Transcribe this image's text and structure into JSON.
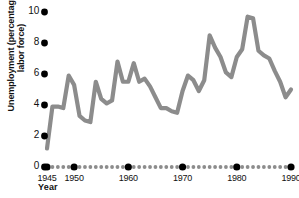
{
  "chart_data": {
    "type": "line",
    "title": "",
    "xlabel": "Year",
    "ylabel": "Unemployment (percentage of labor force)",
    "xlim": [
      1945,
      1990
    ],
    "ylim": [
      0,
      10
    ],
    "grid": false,
    "legend": false,
    "line_color": "#8c8c8c",
    "x": [
      1945,
      1946,
      1947,
      1948,
      1949,
      1950,
      1951,
      1952,
      1953,
      1954,
      1955,
      1956,
      1957,
      1958,
      1959,
      1960,
      1961,
      1962,
      1963,
      1964,
      1965,
      1966,
      1967,
      1968,
      1969,
      1970,
      1971,
      1972,
      1973,
      1974,
      1975,
      1976,
      1977,
      1978,
      1979,
      1980,
      1981,
      1982,
      1983,
      1984,
      1985,
      1986,
      1987,
      1988,
      1989,
      1990
    ],
    "values": [
      1.2,
      3.9,
      3.9,
      3.8,
      5.9,
      5.3,
      3.3,
      3.0,
      2.9,
      5.5,
      4.4,
      4.1,
      4.3,
      6.8,
      5.5,
      5.5,
      6.7,
      5.5,
      5.7,
      5.2,
      4.5,
      3.8,
      3.8,
      3.6,
      3.5,
      4.9,
      5.9,
      5.6,
      4.9,
      5.6,
      8.5,
      7.7,
      7.1,
      6.1,
      5.8,
      7.1,
      7.6,
      9.7,
      9.6,
      7.5,
      7.2,
      7.0,
      6.2,
      5.5,
      4.5,
      5.0
    ],
    "yticks": [
      {
        "label": "10",
        "value": 10
      },
      {
        "label": "8",
        "value": 8
      },
      {
        "label": "6",
        "value": 6
      },
      {
        "label": "4",
        "value": 4
      },
      {
        "label": "2",
        "value": 2
      },
      {
        "label": "0",
        "value": 0
      }
    ],
    "xticks_major": [
      {
        "label": "1945",
        "value": 1945
      },
      {
        "label": "1950",
        "value": 1950
      },
      {
        "label": "1960",
        "value": 1960
      },
      {
        "label": "1970",
        "value": 1970
      },
      {
        "label": "1980",
        "value": 1980
      },
      {
        "label": "1990",
        "value": 1990
      }
    ],
    "xticks_minor_years": [
      1946,
      1947,
      1948,
      1949,
      1951,
      1952,
      1953,
      1954,
      1955,
      1956,
      1957,
      1958,
      1959,
      1961,
      1962,
      1963,
      1964,
      1965,
      1966,
      1967,
      1968,
      1969,
      1971,
      1972,
      1973,
      1974,
      1975,
      1976,
      1977,
      1978,
      1979,
      1981,
      1982,
      1983,
      1984,
      1985,
      1986,
      1987,
      1988,
      1989
    ]
  }
}
